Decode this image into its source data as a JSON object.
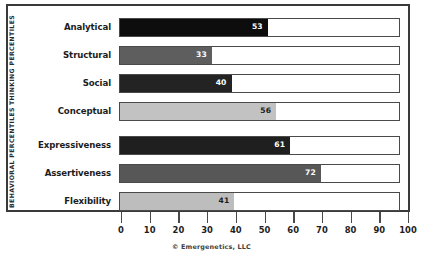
{
  "chart_data": {
    "type": "bar",
    "orientation": "horizontal",
    "title": "",
    "xlabel": "",
    "ylabel": "",
    "xlim": [
      0,
      100
    ],
    "xticks": [
      "0",
      "10",
      "20",
      "30",
      "40",
      "50",
      "60",
      "70",
      "80",
      "90",
      "100"
    ],
    "grid": false,
    "legend": "none",
    "categories": [
      "Analytical",
      "Structural",
      "Social",
      "Conceptual",
      "Expressiveness",
      "Assertiveness",
      "Flexibility"
    ],
    "values": [
      53,
      33,
      40,
      56,
      61,
      72,
      41
    ],
    "bars": [
      {
        "label": "Analytical",
        "value": 53,
        "value_text": "53",
        "fill": "#0d0d0d",
        "text_color": "#ffffff",
        "group": "THINKING PERCENTILES"
      },
      {
        "label": "Structural",
        "value": 33,
        "value_text": "33",
        "fill": "#5e5e5e",
        "text_color": "#ffffff",
        "group": "THINKING PERCENTILES"
      },
      {
        "label": "Social",
        "value": 40,
        "value_text": "40",
        "fill": "#232323",
        "text_color": "#ffffff",
        "group": "THINKING PERCENTILES"
      },
      {
        "label": "Conceptual",
        "value": 56,
        "value_text": "56",
        "fill": "#c2c2c2",
        "text_color": "#1d1d1d",
        "group": "THINKING PERCENTILES"
      },
      {
        "label": "Expressiveness",
        "value": 61,
        "value_text": "61",
        "fill": "#1f1f1f",
        "text_color": "#ffffff",
        "group": "BEHAVIORAL PERCENTILES"
      },
      {
        "label": "Assertiveness",
        "value": 72,
        "value_text": "72",
        "fill": "#575757",
        "text_color": "#ffffff",
        "group": "BEHAVIORAL PERCENTILES"
      },
      {
        "label": "Flexibility",
        "value": 41,
        "value_text": "41",
        "fill": "#bdbdbd",
        "text_color": "#1d1d1d",
        "group": "BEHAVIORAL PERCENTILES"
      }
    ],
    "groups": [
      {
        "name": "THINKING PERCENTILES",
        "count": 4
      },
      {
        "name": "BEHAVIORAL PERCENTILES",
        "count": 3
      }
    ],
    "annotations": [
      "© Emergenetics, LLC"
    ]
  },
  "axis": {
    "caption": "© Emergenetics, LLC"
  },
  "colors": {
    "border": "#3a3a3a",
    "track_border": "#4a4a4a",
    "background": "#ffffff",
    "text": "#1d1d1d"
  }
}
